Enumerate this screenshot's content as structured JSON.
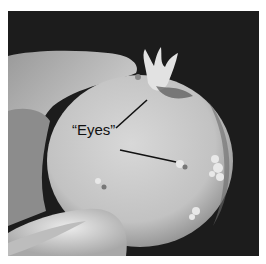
{
  "figure": {
    "type": "photograph",
    "annotation": {
      "label": "“Eyes”",
      "pointers": 2
    },
    "colors": {
      "background": "#1c1c1c",
      "potato": "#c9c9c9",
      "hand": "#b5b5b5",
      "text": "#111111"
    }
  }
}
